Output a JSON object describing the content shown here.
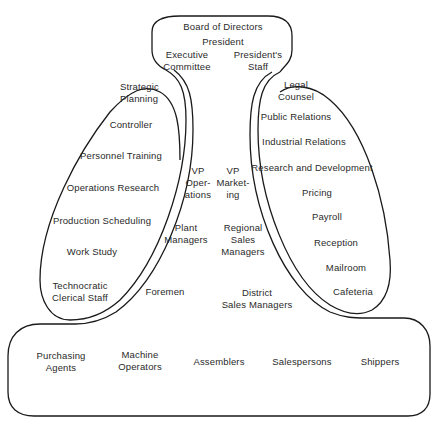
{
  "diagram": {
    "type": "organization-structure",
    "strategic_apex": {
      "items": [
        "Board of Directors",
        "President",
        "Executive\nCommittee",
        "President's\nStaff"
      ]
    },
    "technostructure": {
      "items": [
        "Strategic\nPlanning",
        "Controller",
        "Personnel Training",
        "Operations Research",
        "Production Scheduling",
        "Work Study",
        "Technocratic\nClerical Staff"
      ]
    },
    "middle_line": {
      "items": [
        "VP\nOper-\nations",
        "VP\nMarket-\ning",
        "Plant\nManagers",
        "Regional\nSales\nManagers",
        "Foremen",
        "District\nSales Managers"
      ]
    },
    "support_staff": {
      "items": [
        "Legal\nCounsel",
        "Public Relations",
        "Industrial Relations",
        "Research and Development",
        "Pricing",
        "Payroll",
        "Reception",
        "Mailroom",
        "Cafeteria"
      ]
    },
    "operating_core": {
      "items": [
        "Purchasing\nAgents",
        "Machine\nOperators",
        "Assemblers",
        "Salespersons",
        "Shippers"
      ]
    },
    "colors": {
      "line": "#1a1a1a",
      "text": "#2a2a2a",
      "background": "#ffffff"
    }
  }
}
